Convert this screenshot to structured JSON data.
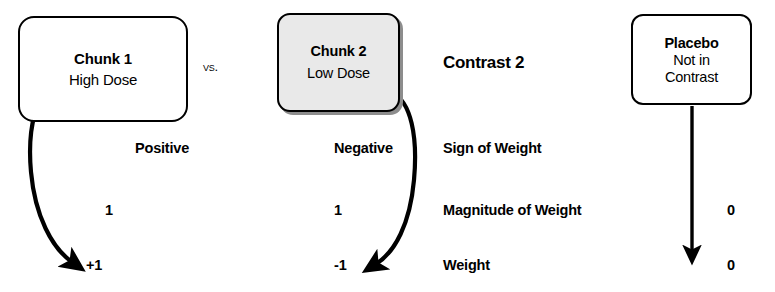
{
  "diagram": {
    "heading": "Contrast 2",
    "comparator": "vs.",
    "nodes": [
      {
        "id": "chunk1",
        "title": "Chunk 1",
        "subtitle": "High Dose",
        "fill": "#ffffff",
        "shadow": false
      },
      {
        "id": "chunk2",
        "title": "Chunk 2",
        "subtitle": "Low Dose",
        "fill": "#e9e9e9",
        "shadow": true
      },
      {
        "id": "placebo",
        "title": "Placebo",
        "subtitle": "Not in",
        "subtitle2": "Contrast",
        "fill": "#ffffff",
        "shadow": false
      }
    ],
    "rows": [
      {
        "label": "Sign of Weight",
        "values": {
          "chunk1": "Positive",
          "chunk2": "Negative",
          "placebo": ""
        }
      },
      {
        "label": "Magnitude of Weight",
        "values": {
          "chunk1": "1",
          "chunk2": "1",
          "placebo": "0"
        }
      },
      {
        "label": "Weight",
        "values": {
          "chunk1": "+1",
          "chunk2": "-1",
          "placebo": "0"
        }
      }
    ],
    "arrows": [
      {
        "id": "arrow-chunk1-to-weight",
        "from": "chunk1",
        "to": "+1",
        "shape": "curved"
      },
      {
        "id": "arrow-chunk2-to-weight",
        "from": "chunk2",
        "to": "-1",
        "shape": "curved"
      },
      {
        "id": "arrow-placebo-to-weight",
        "from": "placebo",
        "to": "0",
        "shape": "straight"
      }
    ],
    "colors": {
      "stroke": "#000000",
      "background": "#ffffff",
      "node_gray": "#e9e9e9",
      "shadow_gray": "#8d8d8d"
    }
  }
}
